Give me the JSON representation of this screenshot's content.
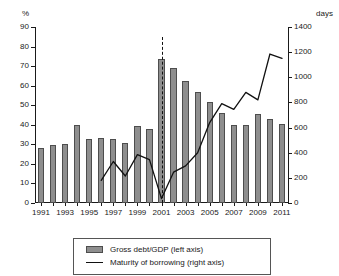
{
  "chart_data": {
    "type": "bar",
    "title": "",
    "subtitle": "",
    "xlabel": "",
    "ylabel": "%",
    "y2label": "days",
    "grid": false,
    "legend_position": "bottom",
    "categories": [
      "1991",
      "1992",
      "1993",
      "1994",
      "1995",
      "1996",
      "1997",
      "1998",
      "1999",
      "2000",
      "2001",
      "2002",
      "2003",
      "2004",
      "2005",
      "2006",
      "2007",
      "2008",
      "2009",
      "2010",
      "2011"
    ],
    "x_tick_labels": [
      "1991",
      "1993",
      "1995",
      "1997",
      "1999",
      "2001",
      "2003",
      "2005",
      "2007",
      "2009",
      "2011"
    ],
    "ylim": [
      0,
      90
    ],
    "y_ticks": [
      0,
      10,
      20,
      30,
      40,
      50,
      60,
      70,
      80,
      90
    ],
    "y2lim": [
      0,
      1400
    ],
    "y2_ticks": [
      0,
      200,
      400,
      600,
      800,
      1000,
      1200,
      1400
    ],
    "series": [
      {
        "name": "Gross debt/GDP (left axis)",
        "type": "bar",
        "axis": "left",
        "color": "#8e8e8e",
        "values": [
          28,
          29.5,
          30.3,
          40,
          32.6,
          33.2,
          32.5,
          30.6,
          39.4,
          37.8,
          73.6,
          69.1,
          62.5,
          57,
          51.7,
          45.8,
          39.9,
          39.9,
          45.6,
          43.2,
          40.3
        ]
      },
      {
        "name": "Maturity of borrowing (right axis)",
        "type": "line",
        "axis": "right",
        "color": "#111111",
        "x": [
          "1996",
          "1997",
          "1998",
          "1999",
          "2000",
          "2001",
          "2002",
          "2003",
          "2004",
          "2005",
          "2006",
          "2007",
          "2008",
          "2009",
          "2010",
          "2011"
        ],
        "values": [
          180,
          330,
          215,
          385,
          345,
          35,
          245,
          295,
          400,
          640,
          790,
          745,
          880,
          820,
          1185,
          1150
        ]
      }
    ],
    "annotations": [
      {
        "type": "vertical-dashed-line",
        "x": "2001",
        "color": "#111111"
      }
    ]
  },
  "legend": {
    "items": [
      {
        "label": "Gross debt/GDP (left axis)",
        "marker": "bar-swatch"
      },
      {
        "label": "Maturity of borrowing (right axis)",
        "marker": "line-swatch"
      }
    ]
  }
}
